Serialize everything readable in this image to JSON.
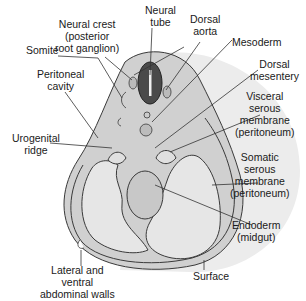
{
  "diagram": {
    "colors": {
      "background": "#ffffff",
      "shadow": "#e4e4e4",
      "body_fill": "#d2d2d2",
      "inner_fill": "#e6e6e6",
      "outline": "#3a3a3a",
      "neural_tube": "#4a4a4a",
      "text": "#1a1a1a"
    },
    "labels": {
      "neural_crest": "Neural crest\n(posterior\nroot ganglion)",
      "neural_tube": "Neural\ntube",
      "dorsal_aorta": "Dorsal\naorta",
      "somite": "Somite",
      "mesoderm": "Mesoderm",
      "peritoneal_cavity": "Peritoneal\ncavity",
      "dorsal_mesentery": "Dorsal\nmesentery",
      "visceral_serous_membrane": "Visceral\nserous\nmembrane\n(peritoneum)",
      "urogenital_ridge": "Urogenital\nridge",
      "somatic_serous_membrane": "Somatic\nserous\nmembrane\n(peritoneum)",
      "endoderm": "Endoderm\n(midgut)",
      "surface": "Surface",
      "lateral_ventral_walls": "Lateral and\nventral\nabdominal walls"
    }
  }
}
